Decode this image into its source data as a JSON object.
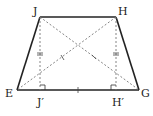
{
  "diagram": {
    "type": "isosceles-trapezoid",
    "vertices": {
      "J": {
        "label": "J",
        "x": 40,
        "y": 17
      },
      "H": {
        "label": "H",
        "x": 116,
        "y": 17
      },
      "E": {
        "label": "E",
        "x": 17,
        "y": 90
      },
      "G": {
        "label": "G",
        "x": 139,
        "y": 90
      },
      "J_prime": {
        "label": "J′",
        "x": 40,
        "y": 90
      },
      "H_prime": {
        "label": "H′",
        "x": 116,
        "y": 90
      }
    },
    "solid_edges": [
      "JH",
      "HG",
      "GE",
      "EJ"
    ],
    "dashed_segments": [
      "JJ′",
      "HH′",
      "JG",
      "HE"
    ],
    "marks": {
      "double_tick": [
        "JJ′",
        "HH′"
      ],
      "single_tick": [
        "JG",
        "HE",
        "J′H′"
      ],
      "right_angle": [
        "J′",
        "H′"
      ]
    },
    "colors": {
      "stroke": "#222222",
      "dashed": "#777777"
    }
  }
}
